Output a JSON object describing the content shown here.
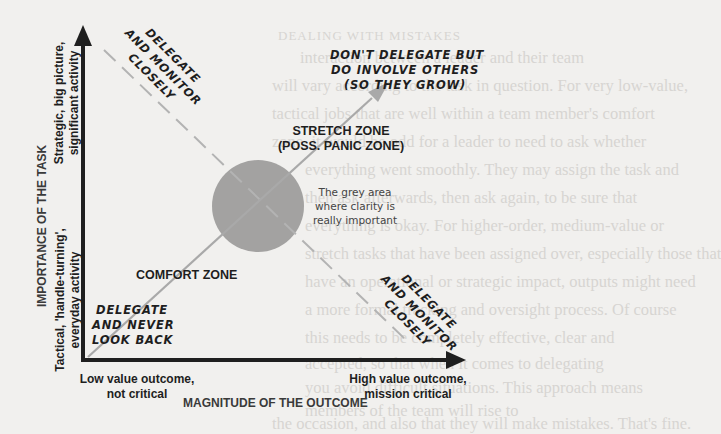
{
  "background_page": {
    "heading": "DEALING WITH MISTAKES",
    "lines": [
      "interaction between a leader and their team",
      "will vary according to the task in question. For very low-value,",
      "tactical jobs that are well within a team member's comfort",
      "zone, it would be odd for a leader to need to ask whether",
      "everything went smoothly. They may assign the task and",
      "then ask afterwards, then ask again, to be sure that",
      "everything is okay. For higher-order, medium-value or",
      "stretch tasks that have been assigned over, especially those that",
      "have an operational or strategic impact, outputs might need",
      "a more formal tracking and oversight process. Of course",
      "this needs to be completely effective, clear and",
      "accepted, so that when it comes to delegating",
      "you avoid difficult situations. This approach means",
      "members of the team will rise to",
      "the occasion, and also that they will make mistakes. That's fine.",
      "because that's how people grow and learn."
    ]
  },
  "diagram": {
    "y_axis": {
      "title": "IMPORTANCE OF THE TASK",
      "high_label": "Strategic, big picture, significant activity",
      "high_label_lines": [
        "Strategic, big picture,",
        "significant activity"
      ],
      "low_label_lines": [
        "Tactical, 'handle-turning',",
        "everyday activity"
      ]
    },
    "x_axis": {
      "title": "MAGNITUDE OF THE OUTCOME",
      "low_label_lines": [
        "Low value outcome,",
        "not critical"
      ],
      "high_label_lines": [
        "High value outcome,",
        "mission critical"
      ]
    },
    "zones": {
      "comfort": "COMFORT ZONE",
      "stretch_lines": [
        "STRETCH ZONE",
        "(POSS. PANIC ZONE)"
      ]
    },
    "advice": {
      "top_right_lines": [
        "DON'T DELEGATE BUT",
        "DO INVOLVE OTHERS",
        "(SO THEY GROW)"
      ],
      "bottom_left_lines": [
        "DELEGATE",
        "AND NEVER",
        "LOOK BACK"
      ],
      "top_left_lines": [
        "DELEGATE",
        "AND MONITOR",
        "CLOSELY"
      ],
      "bottom_right_lines": [
        "DELEGATE",
        "AND MONITOR",
        "CLOSELY"
      ]
    },
    "grey_area_note_lines": [
      "The grey area",
      "where clarity is",
      "really important"
    ],
    "colors": {
      "axis": "#1f1f1f",
      "diagonal_line": "#a9a9a9",
      "dashed_line": "#b3b3b3",
      "grey_circle": "#a3a2a1",
      "page_background": "#f1f0ee"
    }
  }
}
